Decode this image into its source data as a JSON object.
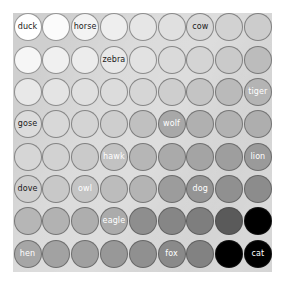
{
  "figure": {
    "type": "grid-of-circles",
    "panel_background": "#cfcfcf",
    "outer_background": "#ffffff",
    "rows": 8,
    "columns": 9,
    "circle_outline": "#464646"
  },
  "chart_data": {
    "type": "heatmap",
    "title": "",
    "xlabel": "",
    "ylabel": "",
    "grid": false,
    "legend": "none",
    "rows": 8,
    "columns": 9,
    "marker": "circle",
    "colorscale": "greyscale-light-to-dark",
    "labels": [
      {
        "row": 1,
        "col": 1,
        "text": "duck",
        "text_color": "#1a1a1a",
        "fill": "#ffffff"
      },
      {
        "row": 1,
        "col": 3,
        "text": "horse",
        "text_color": "#1a1a1a",
        "fill": "#f3f3f3"
      },
      {
        "row": 1,
        "col": 7,
        "text": "cow",
        "text_color": "#1a1a1a",
        "fill": "#d8d8d8"
      },
      {
        "row": 2,
        "col": 4,
        "text": "zebra",
        "text_color": "#1a1a1a",
        "fill": "#e8e8e8"
      },
      {
        "row": 3,
        "col": 9,
        "text": "tiger",
        "text_color": "#1a1a1a",
        "fill": "#b4b4b4"
      },
      {
        "row": 4,
        "col": 1,
        "text": "gose",
        "text_color": "#1a1a1a",
        "fill": "#dcdcdc"
      },
      {
        "row": 4,
        "col": 6,
        "text": "wolf",
        "text_color": "#ffffff",
        "fill": "#a8a8a8"
      },
      {
        "row": 5,
        "col": 4,
        "text": "hawk",
        "text_color": "#ffffff",
        "fill": "#c2c2c2"
      },
      {
        "row": 5,
        "col": 9,
        "text": "lion",
        "text_color": "#ffffff",
        "fill": "#9a9a9a"
      },
      {
        "row": 6,
        "col": 1,
        "text": "dove",
        "text_color": "#1a1a1a",
        "fill": "#cfcfcf"
      },
      {
        "row": 6,
        "col": 3,
        "text": "owl",
        "text_color": "#ffffff",
        "fill": "#c4c4c4"
      },
      {
        "row": 6,
        "col": 7,
        "text": "dog",
        "text_color": "#ffffff",
        "fill": "#949494"
      },
      {
        "row": 7,
        "col": 4,
        "text": "eagle",
        "text_color": "#ffffff",
        "fill": "#ababab"
      },
      {
        "row": 8,
        "col": 1,
        "text": "hen",
        "text_color": "#ffffff",
        "fill": "#a6a6a6"
      },
      {
        "row": 8,
        "col": 6,
        "text": "fox",
        "text_color": "#ffffff",
        "fill": "#8a8a8a"
      },
      {
        "row": 8,
        "col": 9,
        "text": "cat",
        "text_color": "#ffffff",
        "fill": "#000000"
      }
    ],
    "cells": [
      [
        {
          "fill": "#ffffff",
          "label": "duck"
        },
        {
          "fill": "#fbfbfb",
          "label": ""
        },
        {
          "fill": "#f3f3f3",
          "label": "horse"
        },
        {
          "fill": "#eeeeee",
          "label": ""
        },
        {
          "fill": "#e6e6e6",
          "label": ""
        },
        {
          "fill": "#e0e0e0",
          "label": ""
        },
        {
          "fill": "#d8d8d8",
          "label": "cow"
        },
        {
          "fill": "#d2d2d2",
          "label": ""
        },
        {
          "fill": "#cccccc",
          "label": ""
        }
      ],
      [
        {
          "fill": "#f6f6f6",
          "label": ""
        },
        {
          "fill": "#f0f0f0",
          "label": ""
        },
        {
          "fill": "#ececec",
          "label": ""
        },
        {
          "fill": "#e8e8e8",
          "label": "zebra"
        },
        {
          "fill": "#e2e2e2",
          "label": ""
        },
        {
          "fill": "#dadada",
          "label": ""
        },
        {
          "fill": "#d4d4d4",
          "label": ""
        },
        {
          "fill": "#cacaca",
          "label": ""
        },
        {
          "fill": "#bcbcbc",
          "label": ""
        }
      ],
      [
        {
          "fill": "#e8e8e8",
          "label": ""
        },
        {
          "fill": "#e4e4e4",
          "label": ""
        },
        {
          "fill": "#e0e0e0",
          "label": ""
        },
        {
          "fill": "#dcdcdc",
          "label": ""
        },
        {
          "fill": "#d6d6d6",
          "label": ""
        },
        {
          "fill": "#cecece",
          "label": ""
        },
        {
          "fill": "#c4c4c4",
          "label": ""
        },
        {
          "fill": "#bababa",
          "label": ""
        },
        {
          "fill": "#b4b4b4",
          "label": "tiger"
        }
      ],
      [
        {
          "fill": "#dcdcdc",
          "label": "gose"
        },
        {
          "fill": "#d8d8d8",
          "label": ""
        },
        {
          "fill": "#d4d4d4",
          "label": ""
        },
        {
          "fill": "#cecece",
          "label": ""
        },
        {
          "fill": "#c0c0c0",
          "label": ""
        },
        {
          "fill": "#a8a8a8",
          "label": "wolf"
        },
        {
          "fill": "#b0b0b0",
          "label": ""
        },
        {
          "fill": "#b2b2b2",
          "label": ""
        },
        {
          "fill": "#aeaeae",
          "label": ""
        }
      ],
      [
        {
          "fill": "#d6d6d6",
          "label": ""
        },
        {
          "fill": "#d2d2d2",
          "label": ""
        },
        {
          "fill": "#cacaca",
          "label": ""
        },
        {
          "fill": "#c2c2c2",
          "label": "hawk"
        },
        {
          "fill": "#b6b6b6",
          "label": ""
        },
        {
          "fill": "#aaaaaa",
          "label": ""
        },
        {
          "fill": "#a4a4a4",
          "label": ""
        },
        {
          "fill": "#9e9e9e",
          "label": ""
        },
        {
          "fill": "#9a9a9a",
          "label": "lion"
        }
      ],
      [
        {
          "fill": "#cfcfcf",
          "label": "dove"
        },
        {
          "fill": "#c8c8c8",
          "label": ""
        },
        {
          "fill": "#c4c4c4",
          "label": "owl"
        },
        {
          "fill": "#bcbcbc",
          "label": ""
        },
        {
          "fill": "#b4b4b4",
          "label": ""
        },
        {
          "fill": "#9c9c9c",
          "label": ""
        },
        {
          "fill": "#949494",
          "label": "dog"
        },
        {
          "fill": "#909090",
          "label": ""
        },
        {
          "fill": "#8c8c8c",
          "label": ""
        }
      ],
      [
        {
          "fill": "#b6b6b6",
          "label": ""
        },
        {
          "fill": "#b2b2b2",
          "label": ""
        },
        {
          "fill": "#aeaeae",
          "label": ""
        },
        {
          "fill": "#ababab",
          "label": "eagle"
        },
        {
          "fill": "#8e8e8e",
          "label": ""
        },
        {
          "fill": "#868686",
          "label": ""
        },
        {
          "fill": "#7e7e7e",
          "label": ""
        },
        {
          "fill": "#5a5a5a",
          "label": ""
        },
        {
          "fill": "#000000",
          "label": ""
        }
      ],
      [
        {
          "fill": "#a6a6a6",
          "label": "hen"
        },
        {
          "fill": "#a2a2a2",
          "label": ""
        },
        {
          "fill": "#a0a0a0",
          "label": ""
        },
        {
          "fill": "#989898",
          "label": ""
        },
        {
          "fill": "#909090",
          "label": ""
        },
        {
          "fill": "#8a8a8a",
          "label": "fox"
        },
        {
          "fill": "#828282",
          "label": ""
        },
        {
          "fill": "#000000",
          "label": ""
        },
        {
          "fill": "#000000",
          "label": "cat"
        }
      ]
    ]
  }
}
